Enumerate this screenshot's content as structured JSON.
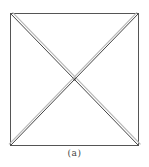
{
  "figure": {
    "caption": "(a)",
    "square": {
      "x1": 10.5,
      "y1": 13.5,
      "x2": 138.5,
      "y2": 145.5
    },
    "colors": {
      "edge": "#555555",
      "diagonal_dark": "#444444",
      "diagonal_light": "#b8b8b8",
      "background": "#ffffff"
    }
  }
}
